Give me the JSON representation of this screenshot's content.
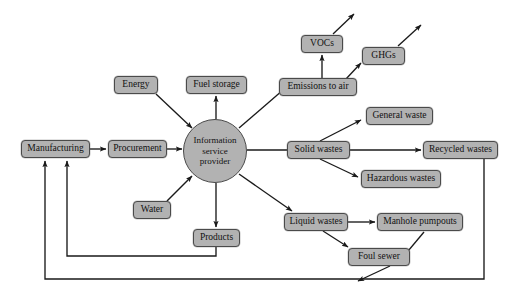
{
  "diagram": {
    "style": {
      "node_fill": "#b2b2b2",
      "node_stroke": "#4a4a4a",
      "line_color": "#1a1a1a",
      "background": "#ffffff"
    },
    "hub": {
      "name": "information-service-provider",
      "line1": "Information",
      "line2": "service",
      "line3": "provider",
      "cx": 215,
      "cy": 151,
      "r": 32
    },
    "nodes": [
      {
        "id": "manufacturing",
        "label": "Manufacturing",
        "x": 21,
        "y": 140,
        "w": 69,
        "h": 18
      },
      {
        "id": "procurement",
        "label": "Procurement",
        "x": 108,
        "y": 140,
        "w": 59,
        "h": 18
      },
      {
        "id": "energy",
        "label": "Energy",
        "x": 114,
        "y": 76,
        "w": 44,
        "h": 18
      },
      {
        "id": "fuel-storage",
        "label": "Fuel storage",
        "x": 186,
        "y": 76,
        "w": 61,
        "h": 18
      },
      {
        "id": "water",
        "label": "Water",
        "x": 133,
        "y": 201,
        "w": 38,
        "h": 18
      },
      {
        "id": "products",
        "label": "Products",
        "x": 193,
        "y": 229,
        "w": 47,
        "h": 18
      },
      {
        "id": "emissions-to-air",
        "label": "Emissions to air",
        "x": 279,
        "y": 78,
        "w": 78,
        "h": 18
      },
      {
        "id": "vocs",
        "label": "VOCs",
        "x": 301,
        "y": 35,
        "w": 42,
        "h": 18
      },
      {
        "id": "ghgs",
        "label": "GHGs",
        "x": 362,
        "y": 47,
        "w": 43,
        "h": 18
      },
      {
        "id": "solid-wastes",
        "label": "Solid wastes",
        "x": 287,
        "y": 141,
        "w": 63,
        "h": 18
      },
      {
        "id": "general-waste",
        "label": "General waste",
        "x": 366,
        "y": 107,
        "w": 67,
        "h": 18
      },
      {
        "id": "recycled-wastes",
        "label": "Recycled wastes",
        "x": 423,
        "y": 141,
        "w": 75,
        "h": 18
      },
      {
        "id": "hazardous-wastes",
        "label": "Hazardous wastes",
        "x": 361,
        "y": 170,
        "w": 80,
        "h": 18
      },
      {
        "id": "liquid-wastes",
        "label": "Liquid wastes",
        "x": 284,
        "y": 213,
        "w": 64,
        "h": 18
      },
      {
        "id": "manhole-pumpouts",
        "label": "Manhole pumpouts",
        "x": 377,
        "y": 213,
        "w": 86,
        "h": 18
      },
      {
        "id": "foul-sewer",
        "label": "Foul sewer",
        "x": 348,
        "y": 248,
        "w": 62,
        "h": 18
      }
    ],
    "edges": [
      {
        "from": "manufacturing",
        "to": "procurement",
        "arrow": true
      },
      {
        "from": "procurement",
        "to": "hub",
        "arrow": true
      },
      {
        "from": "energy",
        "to": "hub",
        "arrow": true
      },
      {
        "from": "hub",
        "to": "fuel-storage",
        "arrow": true
      },
      {
        "from": "water",
        "to": "hub",
        "arrow": true
      },
      {
        "from": "hub",
        "to": "products",
        "arrow": true
      },
      {
        "from": "hub",
        "to": "emissions-to-air",
        "arrow": false
      },
      {
        "from": "emissions-to-air",
        "to": "vocs",
        "arrow": true
      },
      {
        "from": "emissions-to-air",
        "to": "ghgs",
        "arrow": true
      },
      {
        "from": "vocs",
        "to": "environment",
        "arrow": true
      },
      {
        "from": "ghgs",
        "to": "environment",
        "arrow": true
      },
      {
        "from": "hub",
        "to": "solid-wastes",
        "arrow": false
      },
      {
        "from": "solid-wastes",
        "to": "general-waste",
        "arrow": true
      },
      {
        "from": "solid-wastes",
        "to": "recycled-wastes",
        "arrow": true
      },
      {
        "from": "solid-wastes",
        "to": "hazardous-wastes",
        "arrow": true
      },
      {
        "from": "hub",
        "to": "liquid-wastes",
        "arrow": true
      },
      {
        "from": "liquid-wastes",
        "to": "manhole-pumpouts",
        "arrow": true
      },
      {
        "from": "liquid-wastes",
        "to": "foul-sewer",
        "arrow": true
      },
      {
        "from": "manhole-pumpouts",
        "to": "environment",
        "arrow": true
      },
      {
        "from": "foul-sewer",
        "to": "environment",
        "arrow": true
      },
      {
        "from": "products",
        "to": "manufacturing",
        "arrow": true
      },
      {
        "from": "recycled-wastes",
        "to": "manufacturing",
        "arrow": true
      }
    ]
  }
}
